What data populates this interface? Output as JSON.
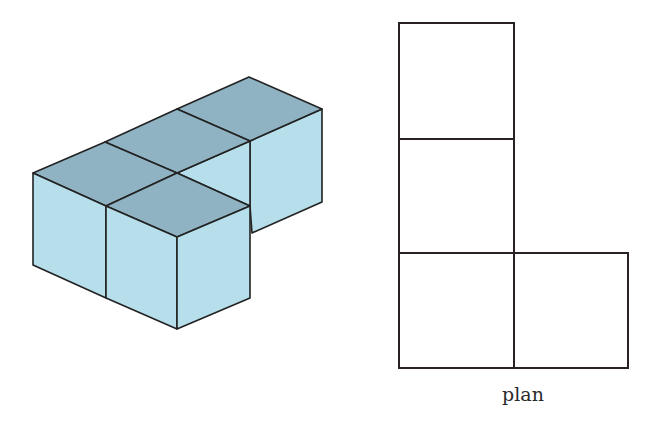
{
  "figure": {
    "isometric_view": {
      "description": "Four unit cubes arranged in an L-shape, isometric drawing",
      "cube_count": 4,
      "colors": {
        "top_face": "#8fb3c3",
        "side_face": "#b6deeb",
        "edge": "#222222"
      }
    },
    "plan_view": {
      "label": "plan",
      "grid": [
        [
          1,
          0
        ],
        [
          1,
          0
        ],
        [
          1,
          1
        ]
      ],
      "colors": {
        "edge": "#2a2222",
        "fill": "#ffffff"
      }
    }
  }
}
